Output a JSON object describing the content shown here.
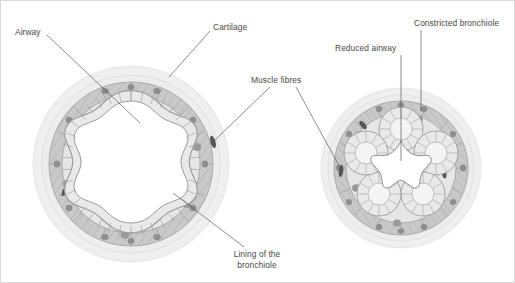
{
  "figure": {
    "background_color": "#ffffff",
    "border_color": "#d9d9d9",
    "label_color": "#4a4a4a",
    "leader_color": "#4f4f4f"
  },
  "palette": {
    "outer_halo": "#f4f4f4",
    "outer_ring": "#ebebeb",
    "adventitia": "#e2e2e2",
    "muscle_band": "#c9c9c9",
    "muscle_band_edge": "#9e9e9e",
    "cartilage": "#bdbdbd",
    "nucleus_dark": "#5a5a5a",
    "nucleus_mid": "#8f8f8f",
    "epithelium_fill": "#e8e8e8",
    "epithelium_edge": "#9a9a9a",
    "lumen": "#ffffff",
    "submucosa": "#ededed"
  },
  "labels": [
    {
      "id": "airway",
      "text": "Airway",
      "lines": [
        "Airway"
      ],
      "x": 14,
      "y": 31,
      "anchor": "start",
      "target_x": 139,
      "target_y": 122,
      "diagram": "normal"
    },
    {
      "id": "cartilage",
      "text": "Cartilage",
      "lines": [
        "Cartilage"
      ],
      "x": 212,
      "y": 26,
      "anchor": "start",
      "target_x": 168,
      "target_y": 76,
      "diagram": "normal"
    },
    {
      "id": "muscle-fibres",
      "text": "Muscle fibres",
      "lines": [
        "Muscle fibres"
      ],
      "x": 250,
      "y": 80,
      "anchor": "start",
      "target_x": 212,
      "target_y": 141,
      "diagram": "both"
    },
    {
      "id": "lining-of-the-bronchiole",
      "text": "Lining of the bronchiole",
      "lines": [
        "Lining of the",
        "bronchiole"
      ],
      "x": 256,
      "y": 258,
      "anchor": "middle",
      "target_x": 172,
      "target_y": 192,
      "diagram": "normal"
    },
    {
      "id": "reduced-airway",
      "text": "Reduced airway",
      "lines": [
        "Reduced airway"
      ],
      "x": 334,
      "y": 47,
      "anchor": "start",
      "target_x": 400,
      "target_y": 160,
      "diagram": "constricted"
    },
    {
      "id": "constricted-bronchiole",
      "text": "Constricted bronchiole",
      "lines": [
        "Constricted bronchiole"
      ],
      "x": 413,
      "y": 22,
      "anchor": "start",
      "target_x": 420,
      "target_y": 110,
      "diagram": "constricted"
    }
  ],
  "diagrams": [
    {
      "id": "normal-bronchiole",
      "name": "Normal bronchiole cross-section",
      "center_x": 130,
      "center_y": 163,
      "outer_radius": 98,
      "lumen_state": "open",
      "lobes": 6
    },
    {
      "id": "constricted-bronchiole",
      "name": "Constricted bronchiole cross-section",
      "center_x": 400,
      "center_y": 167,
      "outer_radius": 80,
      "lumen_state": "constricted",
      "lobes": 6
    }
  ]
}
